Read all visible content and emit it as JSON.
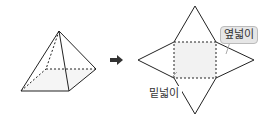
{
  "diagram": {
    "arrow": "→",
    "labels": {
      "lateral_area": "옆넓이",
      "base_area": "밑넓이"
    },
    "colors": {
      "line": "#222222",
      "base_fill": "#f2f2f2",
      "bubble_fill": "#e6e6e6"
    }
  }
}
